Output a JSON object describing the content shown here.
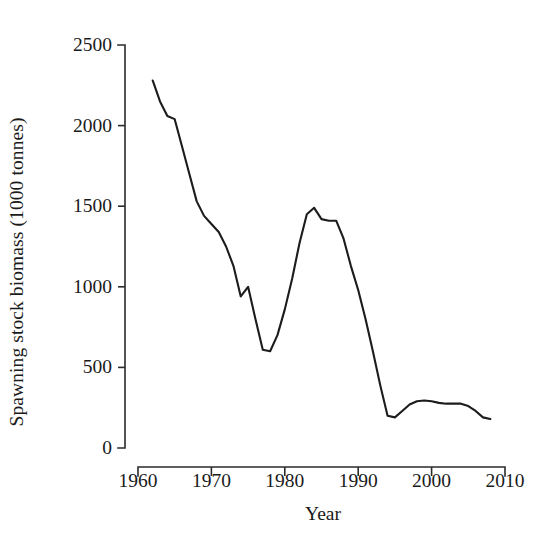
{
  "chart_data": {
    "type": "line",
    "title": "",
    "xlabel": "Year",
    "ylabel": "Spawning stock biomass (1000 tonnes)",
    "xlim": [
      1960,
      2010
    ],
    "ylim": [
      0,
      2500
    ],
    "xticks": [
      1960,
      1970,
      1980,
      1990,
      2000,
      2010
    ],
    "xtick_labels": [
      "1960",
      "1970",
      "1980",
      "1990",
      "2000",
      "2010"
    ],
    "yticks": [
      0,
      500,
      1000,
      1500,
      2000,
      2500
    ],
    "ytick_labels": [
      "0",
      "500",
      "1000",
      "1500",
      "2000",
      "2500"
    ],
    "grid": false,
    "legend": false,
    "line_color": "#1c1c1c",
    "axis_color": "#2b2b2b",
    "background_color": "#ffffff",
    "series": [
      {
        "name": "Spawning stock biomass",
        "x": [
          1962,
          1963,
          1964,
          1965,
          1966,
          1967,
          1968,
          1969,
          1970,
          1971,
          1972,
          1973,
          1974,
          1975,
          1976,
          1977,
          1978,
          1979,
          1980,
          1981,
          1982,
          1983,
          1984,
          1985,
          1986,
          1987,
          1988,
          1989,
          1990,
          1991,
          1992,
          1993,
          1994,
          1995,
          1996,
          1997,
          1998,
          1999,
          2000,
          2001,
          2002,
          2003,
          2004,
          2005,
          2006,
          2007,
          2008
        ],
        "values": [
          2280,
          2150,
          2060,
          2040,
          1870,
          1700,
          1530,
          1440,
          1390,
          1340,
          1250,
          1130,
          940,
          1000,
          800,
          610,
          600,
          700,
          860,
          1050,
          1270,
          1450,
          1490,
          1420,
          1410,
          1410,
          1300,
          1130,
          980,
          800,
          600,
          390,
          200,
          190,
          230,
          270,
          290,
          295,
          290,
          280,
          275,
          275,
          275,
          260,
          230,
          190,
          180
        ]
      }
    ]
  }
}
